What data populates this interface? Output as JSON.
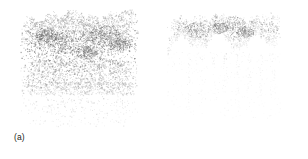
{
  "figure": {
    "background_color": "#ffffff",
    "width": 308,
    "height": 159,
    "panel_count": 2
  },
  "panels": [
    {
      "id": "a",
      "caption": "(a)",
      "content_type": "point-cloud",
      "description": "dense forest canopy point cloud, full resolution",
      "point_color_dark": "#555555",
      "point_color_mid": "#8a8a8a",
      "point_color_light": "#bcbcbc",
      "bounds": {
        "x": 20,
        "y": 8,
        "width": 118,
        "height": 118
      },
      "point_count": 5200,
      "canopy_top_y": 10,
      "canopy_bottom_y": 70,
      "understory_bottom_y": 126,
      "crown_peaks_x": [
        30,
        52,
        72,
        92,
        112,
        128
      ],
      "density_profile": "dense-crown-fading-understory"
    },
    {
      "id": "b",
      "caption": "(b)",
      "content_type": "point-cloud",
      "description": "filtered canopy point cloud with sparse vertical stem traces",
      "point_color_dark": "#666666",
      "point_color_mid": "#9a9a9a",
      "point_color_light": "#c8c8c8",
      "bounds": {
        "x": 13,
        "y": 10,
        "width": 113,
        "height": 108
      },
      "point_count": 2100,
      "canopy_top_y": 12,
      "canopy_bottom_y": 52,
      "understory_bottom_y": 118,
      "stem_positions_x": [
        22,
        34,
        46,
        58,
        70,
        82,
        94,
        106
      ],
      "density_profile": "canopy-band-with-stem-drips"
    }
  ],
  "captions": {
    "a": "(a)",
    "b": "(b)"
  }
}
